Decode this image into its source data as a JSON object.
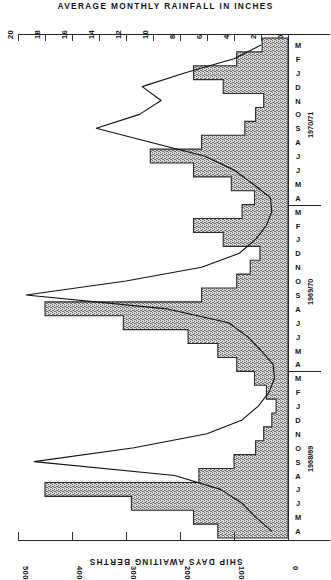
{
  "chart_data": {
    "type": "bar",
    "title": "AVERAGE MONTHLY RAINFALL IN INCHES",
    "subtitle": "",
    "orientation": "horizontal",
    "xlabel": "SHIP DAYS AWAITING BERTHS",
    "ylabel": "",
    "grid": false,
    "legend_position": "none",
    "top_axis": {
      "label": "AVERAGE MONTHLY RAINFALL IN INCHES",
      "ticks": [
        20,
        18,
        16,
        14,
        12,
        10,
        8,
        6,
        4,
        2,
        0
      ],
      "range": [
        20,
        0
      ],
      "direction": "right-to-left-decreasing",
      "units": "inches"
    },
    "bottom_axis": {
      "label": "SHIP DAYS AWAITING BERTHS",
      "ticks": [
        500,
        400,
        300,
        200,
        100,
        0
      ],
      "range": [
        500,
        0
      ],
      "direction": "right-to-left-decreasing",
      "units": "ship days"
    },
    "categories": [
      "A",
      "M",
      "J",
      "J",
      "A",
      "S",
      "O",
      "N",
      "D",
      "J",
      "F",
      "M",
      "A",
      "M",
      "J",
      "J",
      "A",
      "S",
      "O",
      "N",
      "D",
      "J",
      "F",
      "M",
      "A",
      "M",
      "J",
      "J",
      "A",
      "S",
      "O",
      "N",
      "D",
      "J",
      "F",
      "M"
    ],
    "year_groups": [
      {
        "label": "1968/69",
        "start": 0,
        "end": 11
      },
      {
        "label": "1969/70",
        "start": 12,
        "end": 23
      },
      {
        "label": "1970/71",
        "start": 24,
        "end": 35
      }
    ],
    "series": [
      {
        "name": "SHIP DAYS AWAITING BERTHS",
        "axis": "bottom",
        "style": "stepped-shaded-bars",
        "values": [
          130,
          175,
          290,
          450,
          165,
          100,
          60,
          45,
          30,
          22,
          40,
          62,
          95,
          130,
          185,
          305,
          450,
          160,
          95,
          70,
          52,
          120,
          175,
          85,
          62,
          105,
          175,
          255,
          160,
          80,
          60,
          45,
          120,
          175,
          95,
          48
        ]
      },
      {
        "name": "AVERAGE MONTHLY RAINFALL IN INCHES",
        "axis": "top",
        "style": "line",
        "values": [
          1.2,
          2.4,
          3.4,
          5.0,
          8.4,
          18.8,
          11.4,
          6.0,
          3.4,
          2.2,
          1.4,
          1.0,
          1.1,
          2.0,
          3.0,
          4.4,
          9.0,
          19.4,
          12.0,
          6.4,
          3.6,
          2.4,
          1.6,
          1.2,
          1.3,
          2.6,
          4.0,
          6.2,
          10.2,
          14.2,
          11.0,
          9.4,
          10.8,
          7.6,
          4.0,
          2.0
        ]
      }
    ]
  },
  "axes": {
    "top_tick_labels": [
      "20",
      "18",
      "16",
      "14",
      "12",
      "10",
      "8",
      "6",
      "4",
      "2",
      "0"
    ],
    "bottom_tick_labels": [
      "500",
      "400",
      "300",
      "200",
      "100",
      "0"
    ],
    "bottom_caption": "SHIP DAYS AWAITING BERTHS",
    "top_caption": "AVERAGE MONTHLY RAINFALL IN INCHES"
  },
  "year_labels": [
    "1968/69",
    "1969/70",
    "1970/71"
  ],
  "colors": {
    "ink": "#1a1a1a",
    "axis": "#222222",
    "bar_fill": "#8d8d8d",
    "bar_edge": "#2a2a2a",
    "line": "#111111",
    "background": "#ffffff"
  }
}
